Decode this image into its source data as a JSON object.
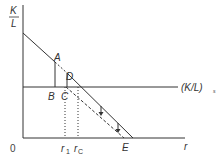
{
  "diagram": {
    "y_axis_label": {
      "num": "K",
      "den": "L"
    },
    "x_axis_label": "r",
    "origin_label": "0",
    "hline_label": "(K/L)",
    "hline_subscript": "s",
    "points": {
      "A": "A",
      "B": "B",
      "C": "C",
      "D": "D",
      "E": "E"
    },
    "ticks": {
      "r1": "r",
      "r1_sub": "1",
      "rc": "r",
      "rc_sub": "C"
    },
    "colors": {
      "line": "#333333",
      "background": "#ffffff"
    }
  }
}
